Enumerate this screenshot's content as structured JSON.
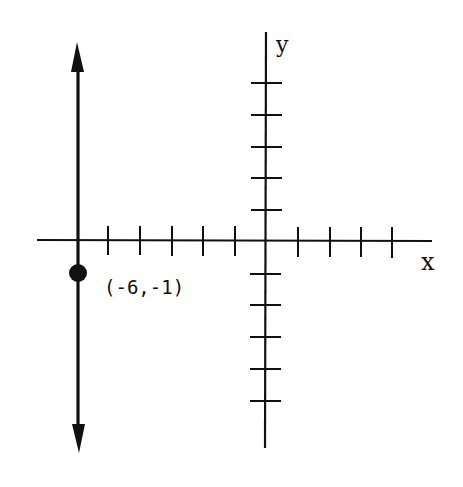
{
  "diagram": {
    "type": "coordinate-plane",
    "colors": {
      "background": "#ffffff",
      "ink": "#111111"
    },
    "axes": {
      "x_label": "x",
      "y_label": "y",
      "x_ticks": [
        -6,
        -5,
        -4,
        -3,
        -2,
        -1,
        1,
        2,
        3,
        4
      ],
      "y_ticks": [
        5,
        4,
        3,
        2,
        1,
        -1,
        -2,
        -3,
        -4,
        -5
      ]
    },
    "point": {
      "x": -6,
      "y": -1,
      "label": "(-6,-1)"
    },
    "line": {
      "equation": "x = -6",
      "orientation": "vertical",
      "arrows": "both"
    }
  }
}
